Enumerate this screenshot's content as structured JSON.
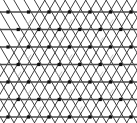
{
  "figure": {
    "title": "Triangular lattice diagram",
    "type": "lattice-diagram",
    "width": 137,
    "height": 123,
    "background_color": "#ffffff"
  },
  "chart_data": {
    "type": "scatter",
    "title": "Triangular lattice diagram",
    "xlabel": "",
    "ylabel": "",
    "grid": true,
    "legend": "none",
    "xlim": [
      0,
      137
    ],
    "ylim": [
      0,
      123
    ],
    "lattice": {
      "rows": 7,
      "columns": 7,
      "x_origin": 8,
      "y_origin": 12,
      "x_spacing": 20.5,
      "y_spacing": 17.5,
      "row_offset": 10.25,
      "vertex_size": 3.2,
      "vertex_color": "#111111",
      "line_color": "#2b2b2b",
      "line_width": 0.9,
      "horizontal_line_color": "#4a4a4a",
      "horizontal_line_width": 1.3,
      "marker_color": "#b9b9b9",
      "marker_width": 0.7
    },
    "line_families": [
      {
        "name": "horizontal",
        "angle_deg": 0,
        "count": 7
      },
      {
        "name": "diagonal-up",
        "angle_deg": 60,
        "count": 14
      },
      {
        "name": "diagonal-down",
        "angle_deg": -60,
        "count": 14
      }
    ],
    "vertex_rows": [
      {
        "row": 0,
        "y": 12.0,
        "x_start": 8.0,
        "count": 7
      },
      {
        "row": 1,
        "y": 29.5,
        "x_start": 18.25,
        "count": 7
      },
      {
        "row": 2,
        "y": 47.0,
        "x_start": 8.0,
        "count": 7
      },
      {
        "row": 3,
        "y": 64.5,
        "x_start": 18.25,
        "count": 7
      },
      {
        "row": 4,
        "y": 82.0,
        "x_start": 8.0,
        "count": 7
      },
      {
        "row": 5,
        "y": 99.5,
        "x_start": 18.25,
        "count": 7
      },
      {
        "row": 6,
        "y": 117.0,
        "x_start": 8.0,
        "count": 7
      }
    ],
    "markers": {
      "glyph": "chevron",
      "note": "small faint grey v-shaped / arrow marks inside a subset of downward triangles",
      "positions": [
        {
          "x": 28,
          "y": 22
        },
        {
          "x": 69,
          "y": 22
        },
        {
          "x": 110,
          "y": 22
        },
        {
          "x": 18,
          "y": 40
        },
        {
          "x": 59,
          "y": 40
        },
        {
          "x": 100,
          "y": 40
        },
        {
          "x": 28,
          "y": 57
        },
        {
          "x": 69,
          "y": 57
        },
        {
          "x": 110,
          "y": 57
        },
        {
          "x": 18,
          "y": 74
        },
        {
          "x": 59,
          "y": 74
        },
        {
          "x": 100,
          "y": 74
        },
        {
          "x": 28,
          "y": 92
        },
        {
          "x": 69,
          "y": 92
        },
        {
          "x": 110,
          "y": 92
        },
        {
          "x": 38,
          "y": 109
        },
        {
          "x": 79,
          "y": 109
        }
      ]
    }
  }
}
